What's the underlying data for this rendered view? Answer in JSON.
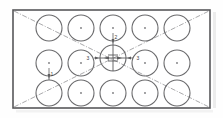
{
  "drawing": {
    "title": "Perforated Rectangular Plate Hole Pattern",
    "type": "engineering-hole-pattern",
    "colors": {
      "outline": "#58585a",
      "hole": "#6a6a6c",
      "centerline": "#9a9a9c",
      "dimension": "#5d5d5f",
      "background": "#fefefe"
    },
    "plate": {
      "name": "rectangular-plate",
      "x": 13,
      "y": 10,
      "width": 197,
      "height": 98
    },
    "hole_grid": {
      "columns": 5,
      "rows": 3,
      "hole_diameter": 26,
      "first_center_x": 49,
      "first_center_y": 28,
      "pitch_x": 32,
      "pitch_y": 35,
      "total_holes": 15
    },
    "centerlines": [
      {
        "name": "diagonal-tl-br",
        "x1": 14,
        "y1": 11,
        "x2": 209,
        "y2": 107
      },
      {
        "name": "diagonal-bl-tr",
        "x1": 14,
        "y1": 107,
        "x2": 209,
        "y2": 11
      }
    ],
    "center_mark": {
      "name": "center-hole-crosshair",
      "cx": 113,
      "cy": 58,
      "arm": 11
    },
    "dimensions": [
      {
        "id": "dim-left-of-center",
        "label": "3",
        "orientation": "horizontal",
        "x": 88,
        "y": 58
      },
      {
        "id": "dim-right-of-center",
        "label": "3",
        "orientation": "horizontal",
        "x": 138,
        "y": 58
      },
      {
        "id": "dim-above-center",
        "label": "2",
        "orientation": "vertical",
        "x": 113,
        "y": 36
      },
      {
        "id": "dim-left-column",
        "label": "1",
        "orientation": "vertical",
        "x": 49,
        "y": 73
      }
    ]
  }
}
